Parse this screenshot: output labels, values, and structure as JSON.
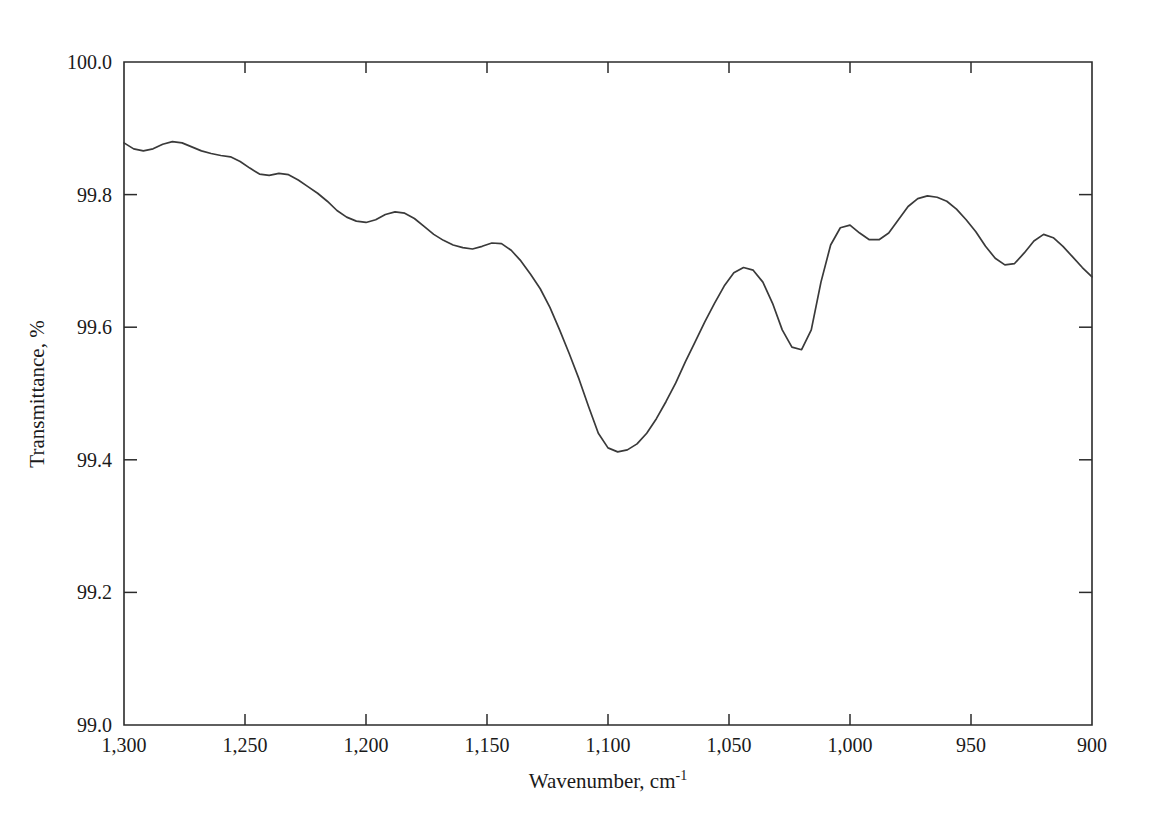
{
  "chart_data": {
    "type": "line",
    "title": "",
    "xlabel": "Wavenumber, cm",
    "xlabel_superscript": "-1",
    "ylabel": "Transmittance, %",
    "xlim": [
      1300,
      900
    ],
    "ylim": [
      99.0,
      100.0
    ],
    "x_inverted": true,
    "grid": false,
    "legend": null,
    "xticks": [
      1300,
      1250,
      1200,
      1150,
      1100,
      1050,
      1000,
      950,
      900
    ],
    "xtick_labels": [
      "1,300",
      "1,250",
      "1,200",
      "1,150",
      "1,100",
      "1,050",
      "1,000",
      "950",
      "900"
    ],
    "yticks": [
      99.0,
      99.2,
      99.4,
      99.6,
      99.8,
      100.0
    ],
    "ytick_labels": [
      "99.0",
      "99.2",
      "99.4",
      "99.6",
      "99.8",
      "100.0"
    ],
    "series": [
      {
        "name": "transmittance",
        "color": "#3a3a3a",
        "x": [
          1300,
          1296,
          1292,
          1288,
          1284,
          1280,
          1276,
          1272,
          1268,
          1264,
          1260,
          1256,
          1252,
          1248,
          1244,
          1240,
          1236,
          1232,
          1228,
          1224,
          1220,
          1216,
          1212,
          1208,
          1204,
          1200,
          1196,
          1192,
          1188,
          1184,
          1180,
          1176,
          1172,
          1168,
          1164,
          1160,
          1156,
          1152,
          1148,
          1144,
          1140,
          1136,
          1132,
          1128,
          1124,
          1120,
          1116,
          1112,
          1108,
          1104,
          1100,
          1096,
          1092,
          1088,
          1084,
          1080,
          1076,
          1072,
          1068,
          1064,
          1060,
          1056,
          1052,
          1048,
          1044,
          1040,
          1036,
          1032,
          1028,
          1024,
          1020,
          1016,
          1012,
          1008,
          1004,
          1000,
          996,
          992,
          988,
          984,
          980,
          976,
          972,
          968,
          964,
          960,
          956,
          952,
          948,
          944,
          940,
          936,
          932,
          928,
          924,
          920,
          916,
          912,
          908,
          904,
          900
        ],
        "y": [
          99.878,
          99.869,
          99.866,
          99.869,
          99.876,
          99.88,
          99.878,
          99.872,
          99.866,
          99.862,
          99.859,
          99.857,
          99.85,
          99.84,
          99.831,
          99.829,
          99.832,
          99.83,
          99.822,
          99.812,
          99.802,
          99.79,
          99.776,
          99.766,
          99.76,
          99.758,
          99.762,
          99.77,
          99.774,
          99.772,
          99.764,
          99.752,
          99.74,
          99.731,
          99.724,
          99.72,
          99.718,
          99.722,
          99.727,
          99.726,
          99.716,
          99.7,
          99.68,
          99.658,
          99.63,
          99.596,
          99.56,
          99.522,
          99.48,
          99.44,
          99.418,
          99.412,
          99.415,
          99.424,
          99.44,
          99.462,
          99.488,
          99.516,
          99.548,
          99.578,
          99.608,
          99.636,
          99.662,
          99.682,
          99.69,
          99.686,
          99.668,
          99.636,
          99.596,
          99.57,
          99.566,
          99.596,
          99.668,
          99.724,
          99.75,
          99.754,
          99.742,
          99.732,
          99.732,
          99.742,
          99.762,
          99.782,
          99.794,
          99.798,
          99.796,
          99.79,
          99.778,
          99.762,
          99.744,
          99.722,
          99.704,
          99.694,
          99.696,
          99.712,
          99.73,
          99.74,
          99.735,
          99.722,
          99.706,
          99.69,
          99.676
        ]
      }
    ],
    "annotations": []
  }
}
